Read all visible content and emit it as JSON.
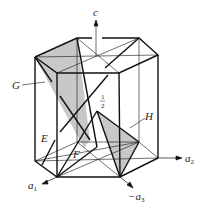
{
  "figure": {
    "labels": {
      "c_axis": "c",
      "a1_axis": "a",
      "a1_sub": "1",
      "a2_axis": "a",
      "a2_sub": "2",
      "a3_axis": "−a",
      "a3_sub": "3",
      "plane_G": "G",
      "plane_H": "H",
      "line_E": "E",
      "line_F": "F",
      "half_num": "1",
      "half_den": "2"
    },
    "colors": {
      "line": "#111111",
      "shade": "#c8c8c8",
      "background": "#ffffff"
    }
  }
}
